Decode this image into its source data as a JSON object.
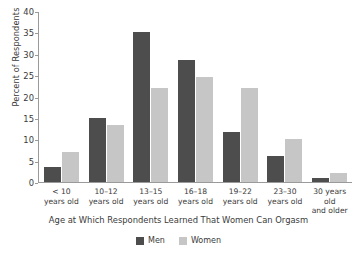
{
  "chart_data": {
    "type": "bar",
    "title": "",
    "xlabel": "Age at Which Respondents Learned That Women Can Orgasm",
    "ylabel": "Percent of Respondents",
    "categories": [
      "< 10 years old",
      "10–12 years old",
      "13–15 years old",
      "16–18 years old",
      "19–22 years old",
      "23–30 years old",
      "30 years old and older"
    ],
    "category_lines": [
      [
        "< 10",
        "years old"
      ],
      [
        "10–12",
        "years old"
      ],
      [
        "13–15",
        "years old"
      ],
      [
        "16–18",
        "years old"
      ],
      [
        "19–22",
        "years old"
      ],
      [
        "23–30",
        "years old"
      ],
      [
        "30 years old",
        "and older"
      ]
    ],
    "series": [
      {
        "name": "Men",
        "color": "#4d4d4d",
        "values": [
          3.5,
          15,
          35,
          28.5,
          11.7,
          6,
          1
        ]
      },
      {
        "name": "Women",
        "color": "#c6c6c6",
        "values": [
          7,
          13.4,
          22,
          24.5,
          22,
          10,
          2
        ]
      }
    ],
    "ylim": [
      0,
      40
    ],
    "yticks": [
      0,
      5,
      10,
      15,
      20,
      25,
      30,
      35,
      40
    ],
    "ytick_labels": [
      "0",
      "5",
      "10",
      "15",
      "20",
      "25",
      "30",
      "35",
      "40"
    ],
    "grid": false,
    "legend_position": "bottom-center"
  }
}
